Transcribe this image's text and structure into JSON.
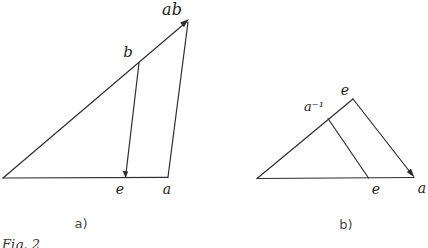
{
  "figure": {
    "caption": "Fig. 2",
    "panel_a": {
      "label": "a)",
      "apex_label": "ab",
      "hypotenuse_point_label": "b",
      "base_point_label": "e",
      "base_right_label": "a"
    },
    "panel_b": {
      "label": "b)",
      "apex_label": "e",
      "edge_point_label": "a⁻¹",
      "base_point_label": "e",
      "base_right_label": "a"
    },
    "colors": {
      "stroke": "#2e2e2e",
      "background": "#ffffff"
    }
  }
}
